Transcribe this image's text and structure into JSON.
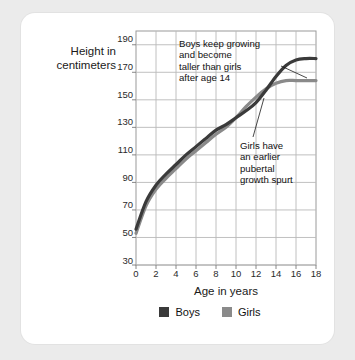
{
  "chart_data": {
    "type": "line",
    "title": "",
    "xlabel": "Age in years",
    "ylabel": "Height in centimeters",
    "xlim": [
      0,
      18
    ],
    "ylim": [
      30,
      200
    ],
    "grid": true,
    "legend_position": "bottom",
    "x": [
      0,
      1,
      2,
      3,
      4,
      5,
      6,
      7,
      8,
      9,
      10,
      11,
      12,
      13,
      14,
      15,
      16,
      17,
      18
    ],
    "xticks": [
      "0",
      "2",
      "4",
      "6",
      "8",
      "10",
      "12",
      "14",
      "16",
      "18"
    ],
    "yticks": [
      "30",
      "50",
      "70",
      "90",
      "110",
      "130",
      "150",
      "170",
      "190"
    ],
    "series": [
      {
        "name": "Boys",
        "color": "#3a3a3a",
        "values": [
          56,
          76,
          88,
          96,
          103,
          110,
          116,
          122,
          128,
          132,
          137,
          142,
          148,
          157,
          167,
          175,
          179,
          180,
          180
        ]
      },
      {
        "name": "Girls",
        "color": "#8a8a8a",
        "values": [
          53,
          73,
          85,
          93,
          100,
          107,
          113,
          119,
          125,
          130,
          137,
          145,
          152,
          158,
          162,
          164,
          164,
          164,
          164
        ]
      }
    ],
    "annotations": [
      {
        "id": "boys-annotation",
        "text": "Boys keep growing\nand become\ntaller than girls\nafter age 14",
        "points_to": "boys-line"
      },
      {
        "id": "girls-annotation",
        "text": "Girls have\nan earlier\npubertal\ngrowth spurt",
        "points_to": "girls-line"
      }
    ]
  },
  "legend": {
    "boys_label": "Boys",
    "girls_label": "Girls",
    "boys_color": "#3a3a3a",
    "girls_color": "#8a8a8a"
  },
  "colors": {
    "page_background": "#ebebeb",
    "card_background": "#ffffff",
    "grid": "#b9b9b9",
    "axis": "#8f8f8f",
    "text": "#111111"
  }
}
